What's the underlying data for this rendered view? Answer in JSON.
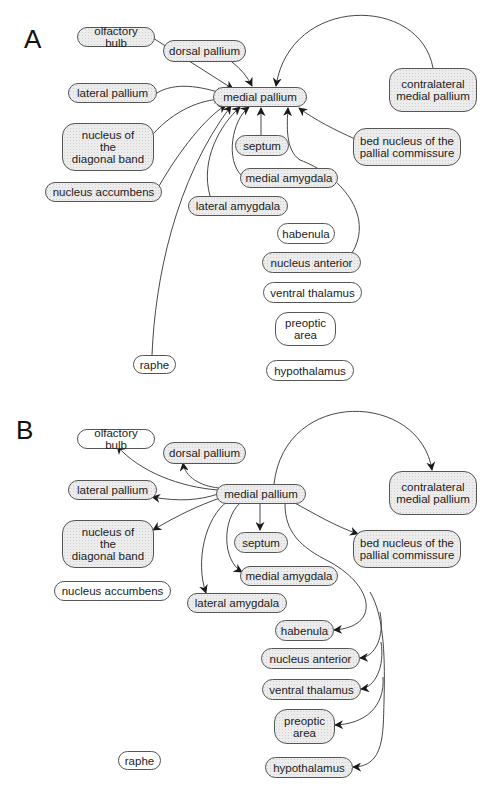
{
  "figure": {
    "panels": [
      {
        "label": "A",
        "offset_y": 0,
        "center": "medial_pallium",
        "direction": "inputs",
        "nodes": [
          {
            "id": "olfactory_bulb",
            "label": "olfactory bulb",
            "x": 77,
            "y": 27,
            "w": 78,
            "h": 20,
            "shaded": true
          },
          {
            "id": "dorsal_pallium",
            "label": "dorsal pallium",
            "x": 163,
            "y": 40,
            "w": 83,
            "h": 22,
            "shaded": true
          },
          {
            "id": "lateral_pallium",
            "label": "lateral pallium",
            "x": 68,
            "y": 83,
            "w": 89,
            "h": 20,
            "shaded": true
          },
          {
            "id": "medial_pallium",
            "label": "medial pallium",
            "x": 213,
            "y": 87,
            "w": 94,
            "h": 20,
            "shaded": true
          },
          {
            "id": "contralateral_medial_pallium",
            "label": "contralateral\nmedial pallium",
            "x": 389,
            "y": 68,
            "w": 88,
            "h": 44,
            "shaded": true,
            "tall": true
          },
          {
            "id": "nucleus_diagonal_band",
            "label": "nucleus of\nthe\ndiagonal band",
            "x": 62,
            "y": 123,
            "w": 92,
            "h": 48,
            "shaded": true,
            "tall": true
          },
          {
            "id": "septum",
            "label": "septum",
            "x": 235,
            "y": 135,
            "w": 54,
            "h": 21,
            "shaded": true
          },
          {
            "id": "bed_nucleus",
            "label": "bed nucleus of the\npallial commissure",
            "x": 353,
            "y": 128,
            "w": 108,
            "h": 38,
            "shaded": true,
            "tall": true
          },
          {
            "id": "nucleus_accumbens",
            "label": "nucleus accumbens",
            "x": 45,
            "y": 182,
            "w": 117,
            "h": 20,
            "shaded": true
          },
          {
            "id": "medial_amygdala",
            "label": "medial amygdala",
            "x": 240,
            "y": 168,
            "w": 98,
            "h": 20,
            "shaded": true
          },
          {
            "id": "lateral_amygdala",
            "label": "lateral amygdala",
            "x": 188,
            "y": 196,
            "w": 100,
            "h": 20,
            "shaded": true
          },
          {
            "id": "habenula",
            "label": "habenula",
            "x": 277,
            "y": 223,
            "w": 58,
            "h": 21,
            "shaded": false
          },
          {
            "id": "nucleus_anterior",
            "label": "nucleus anterior",
            "x": 262,
            "y": 252,
            "w": 99,
            "h": 21,
            "shaded": true
          },
          {
            "id": "ventral_thalamus",
            "label": "ventral thalamus",
            "x": 263,
            "y": 282,
            "w": 99,
            "h": 21,
            "shaded": false
          },
          {
            "id": "preoptic_area",
            "label": "preoptic\narea",
            "x": 275,
            "y": 312,
            "w": 61,
            "h": 34,
            "shaded": false,
            "tall": true
          },
          {
            "id": "raphe",
            "label": "raphe",
            "x": 133,
            "y": 355,
            "w": 43,
            "h": 19,
            "shaded": false
          },
          {
            "id": "hypothalamus",
            "label": "hypothalamus",
            "x": 266,
            "y": 360,
            "w": 88,
            "h": 21,
            "shaded": false
          }
        ],
        "edges": [
          {
            "from": "olfactory_bulb",
            "to": "medial_pallium",
            "path": "M153,38 L233,89"
          },
          {
            "from": "dorsal_pallium",
            "to": "medial_pallium",
            "path": "M232,62 Q245,72 252,86"
          },
          {
            "from": "contralateral_medial_pallium",
            "to": "medial_pallium",
            "path": "M433,68 C420,-5 290,-5 276,86"
          },
          {
            "from": "lateral_pallium",
            "to": "medial_pallium",
            "path": "M157,93 C175,82 200,86 224,94"
          },
          {
            "from": "nucleus_diagonal_band",
            "to": "medial_pallium",
            "path": "M153,134 C175,110 200,100 222,99"
          },
          {
            "from": "nucleus_accumbens",
            "to": "medial_pallium",
            "path": "M159,186 C180,150 205,118 226,105"
          },
          {
            "from": "raphe",
            "to": "medial_pallium",
            "path": "M152,355 C155,280 175,180 231,106"
          },
          {
            "from": "lateral_amygdala",
            "to": "medial_pallium",
            "path": "M210,196 C200,160 220,125 240,107"
          },
          {
            "from": "medial_amygdala",
            "to": "medial_pallium",
            "path": "M242,176 C225,160 232,120 249,107"
          },
          {
            "from": "septum",
            "to": "medial_pallium",
            "path": "M261,135 L261,108"
          },
          {
            "from": "nucleus_anterior",
            "to": "medial_pallium",
            "path": "M352,253 C375,215 340,175 300,160 C285,150 287,125 288,108"
          },
          {
            "from": "bed_nucleus",
            "to": "medial_pallium",
            "path": "M355,139 C335,130 315,120 299,108"
          }
        ]
      },
      {
        "label": "B",
        "offset_y": 407,
        "center": "medial_pallium",
        "direction": "outputs",
        "nodes": [
          {
            "id": "olfactory_bulb",
            "label": "olfactory bulb",
            "x": 77,
            "y": 27,
            "w": 78,
            "h": 20,
            "shaded": false
          },
          {
            "id": "dorsal_pallium",
            "label": "dorsal pallium",
            "x": 163,
            "y": 40,
            "w": 83,
            "h": 22,
            "shaded": true
          },
          {
            "id": "lateral_pallium",
            "label": "lateral pallium",
            "x": 68,
            "y": 78,
            "w": 89,
            "h": 20,
            "shaded": true
          },
          {
            "id": "medial_pallium",
            "label": "medial pallium",
            "x": 216,
            "y": 82,
            "w": 90,
            "h": 20,
            "shaded": true
          },
          {
            "id": "contralateral_medial_pallium",
            "label": "contralateral\nmedial pallium",
            "x": 389,
            "y": 69,
            "w": 88,
            "h": 44,
            "shaded": true,
            "tall": true
          },
          {
            "id": "nucleus_diagonal_band",
            "label": "nucleus of\nthe\ndiagonal band",
            "x": 62,
            "y": 118,
            "w": 92,
            "h": 48,
            "shaded": true,
            "tall": true
          },
          {
            "id": "septum",
            "label": "septum",
            "x": 234,
            "y": 130,
            "w": 54,
            "h": 21,
            "shaded": true
          },
          {
            "id": "bed_nucleus",
            "label": "bed nucleus of the\npallial commissure",
            "x": 353,
            "y": 128,
            "w": 108,
            "h": 38,
            "shaded": true,
            "tall": true
          },
          {
            "id": "nucleus_accumbens",
            "label": "nucleus accumbens",
            "x": 54,
            "y": 179,
            "w": 117,
            "h": 20,
            "shaded": false
          },
          {
            "id": "medial_amygdala",
            "label": "medial amygdala",
            "x": 240,
            "y": 164,
            "w": 98,
            "h": 20,
            "shaded": true
          },
          {
            "id": "lateral_amygdala",
            "label": "lateral amygdala",
            "x": 187,
            "y": 191,
            "w": 100,
            "h": 20,
            "shaded": true
          },
          {
            "id": "habenula",
            "label": "habenula",
            "x": 275,
            "y": 218,
            "w": 59,
            "h": 21,
            "shaded": true
          },
          {
            "id": "nucleus_anterior",
            "label": "nucleus anterior",
            "x": 261,
            "y": 246,
            "w": 99,
            "h": 21,
            "shaded": true
          },
          {
            "id": "ventral_thalamus",
            "label": "ventral thalamus",
            "x": 262,
            "y": 277,
            "w": 99,
            "h": 21,
            "shaded": true
          },
          {
            "id": "preoptic_area",
            "label": "preoptic\narea",
            "x": 274,
            "y": 307,
            "w": 61,
            "h": 35,
            "shaded": true,
            "tall": true
          },
          {
            "id": "raphe",
            "label": "raphe",
            "x": 118,
            "y": 349,
            "w": 43,
            "h": 19,
            "shaded": false
          },
          {
            "id": "hypothalamus",
            "label": "hypothalamus",
            "x": 265,
            "y": 355,
            "w": 88,
            "h": 21,
            "shaded": true
          }
        ],
        "edges": [
          {
            "from": "medial_pallium",
            "to": "olfactory_bulb",
            "path": "M218,88 C180,85 140,70 117,44"
          },
          {
            "from": "medial_pallium",
            "to": "dorsal_pallium",
            "path": "M219,86 C200,84 185,75 183,61"
          },
          {
            "from": "medial_pallium",
            "to": "lateral_pallium",
            "path": "M218,92 C200,98 180,100 152,95"
          },
          {
            "from": "medial_pallium",
            "to": "nucleus_diagonal_band",
            "path": "M220,96 C200,103 180,112 153,128"
          },
          {
            "from": "medial_pallium",
            "to": "lateral_amygdala",
            "path": "M228,99 C205,115 195,160 206,191"
          },
          {
            "from": "medial_pallium",
            "to": "medial_amygdala",
            "path": "M240,101 C222,118 222,158 242,170"
          },
          {
            "from": "medial_pallium",
            "to": "septum",
            "path": "M260,102 L260,128"
          },
          {
            "from": "medial_pallium",
            "to": "contralateral_medial_pallium",
            "path": "M274,82 C285,-15 420,-10 432,68"
          },
          {
            "from": "medial_pallium",
            "to": "bed_nucleus",
            "path": "M293,100 C315,112 335,124 358,132"
          },
          {
            "from": "medial_pallium",
            "to": "habenula",
            "path": "M285,102 C285,130 300,145 330,160 C375,185 380,225 334,228"
          },
          {
            "from": "medial_pallium",
            "to": "nucleus_anterior",
            "path": "M380,210 C385,235 375,255 360,256"
          },
          {
            "from": "medial_pallium",
            "to": "ventral_thalamus",
            "path": "M381,240 C385,265 375,285 361,287"
          },
          {
            "from": "medial_pallium",
            "to": "preoptic_area",
            "path": "M383,275 C385,305 365,322 335,323"
          },
          {
            "from": "medial_pallium",
            "to": "hypothalamus",
            "path": "M370,190 C385,215 385,260 384,300 C383,330 385,365 353,365"
          }
        ]
      }
    ]
  }
}
